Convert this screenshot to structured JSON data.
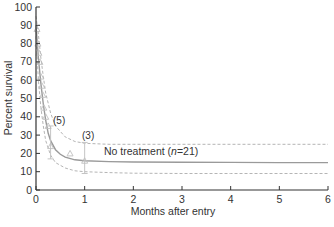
{
  "chart_data": {
    "type": "line",
    "title": "",
    "xlabel": "Months after entry",
    "ylabel": "Percent survival",
    "xlim": [
      0,
      6
    ],
    "ylim": [
      0,
      100
    ],
    "xticks": [
      0,
      1,
      2,
      3,
      4,
      5,
      6
    ],
    "yticks": [
      0,
      10,
      20,
      30,
      40,
      50,
      60,
      70,
      80,
      90,
      100
    ],
    "grid": false,
    "legend": null,
    "series": [
      {
        "name": "No treatment (n=21) fitted survival",
        "style": "solid",
        "x": [
          0,
          0.05,
          0.1,
          0.15,
          0.2,
          0.25,
          0.3,
          0.4,
          0.5,
          0.6,
          0.8,
          1.0,
          1.5,
          2,
          3,
          4,
          5,
          6
        ],
        "y": [
          90,
          72,
          58,
          47,
          38,
          31,
          27,
          22,
          19.5,
          18,
          16.5,
          16,
          15.5,
          15.3,
          15.2,
          15.1,
          15.0,
          15.0
        ]
      },
      {
        "name": "Upper confidence bound",
        "style": "dashed",
        "x": [
          0,
          0.05,
          0.1,
          0.15,
          0.2,
          0.3,
          0.4,
          0.6,
          0.8,
          1.0,
          1.5,
          2,
          3,
          4,
          5,
          6
        ],
        "y": [
          95,
          85,
          72,
          62,
          53,
          42,
          35,
          29,
          26.5,
          25.5,
          25,
          25,
          25,
          25,
          25,
          25
        ]
      },
      {
        "name": "Lower confidence bound",
        "style": "dashed",
        "x": [
          0,
          0.05,
          0.1,
          0.15,
          0.2,
          0.3,
          0.4,
          0.6,
          0.8,
          1.0,
          1.5,
          2,
          3,
          4,
          5,
          6
        ],
        "y": [
          84,
          60,
          45,
          35,
          27,
          19,
          15,
          12,
          10.5,
          10,
          9.5,
          9.2,
          9,
          9,
          9,
          9
        ]
      }
    ],
    "observed_points": {
      "marker": "triangle",
      "x": [
        0.02,
        0.04,
        0.06,
        0.08,
        0.1,
        0.12,
        0.14,
        0.16,
        0.2,
        0.25,
        0.3,
        0.7,
        1.0
      ],
      "y": [
        88,
        80,
        75,
        70,
        62,
        57,
        52,
        45,
        40,
        35,
        24,
        20,
        16
      ],
      "error_bars": [
        {
          "x": 0.3,
          "y": 24,
          "low": 17,
          "high": 35
        },
        {
          "x": 1.0,
          "y": 16,
          "low": 9,
          "high": 26
        }
      ]
    },
    "annotations": [
      {
        "text": "(5)",
        "x": 0.38,
        "y": 38
      },
      {
        "text": "(3)",
        "x": 0.92,
        "y": 28
      },
      {
        "text_prefix": "No treatment (",
        "text_italic": "n",
        "text_suffix": "=21)",
        "x": 1.2,
        "y": 18
      }
    ]
  },
  "labels": {
    "xlabel": "Months after entry",
    "ylabel": "Percent survival",
    "ann5": "(5)",
    "ann3": "(3)",
    "nt_prefix": "No treatment (",
    "nt_italic": "n",
    "nt_suffix": "=21)"
  }
}
